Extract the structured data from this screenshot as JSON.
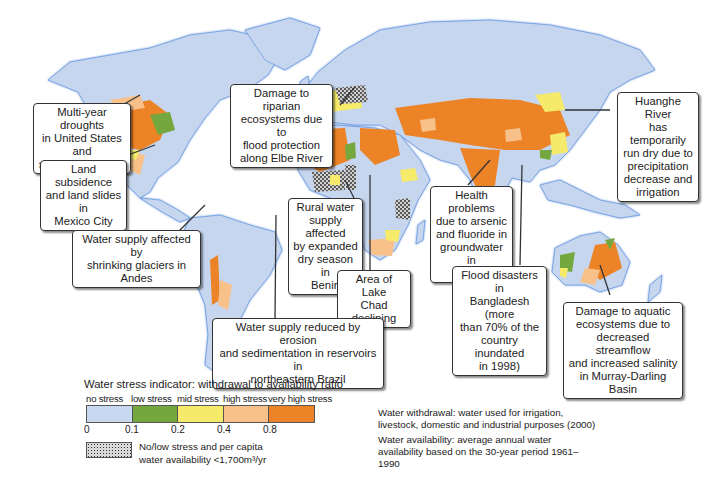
{
  "map": {
    "title": "Water stress and water-related impacts worldwide",
    "colors": {
      "ocean": "#ffffff",
      "land_no_stress": "#c6d6ef",
      "coast": "#6d9be0",
      "border": "#333333"
    }
  },
  "callouts": [
    {
      "id": "us-droughts",
      "text": "Multi-year droughts\nin United States and\nsouthern Canada"
    },
    {
      "id": "mexico-city",
      "text": "Land subsidence\nand land slides in\nMexico City"
    },
    {
      "id": "andes",
      "text": "Water supply affected by\nshrinking glaciers in Andes"
    },
    {
      "id": "elbe",
      "text": "Damage to riparian\necosystems due to\nflood protection\nalong Elbe River"
    },
    {
      "id": "benin",
      "text": "Rural water\nsupply affected\nby expanded\ndry season in\nBenin"
    },
    {
      "id": "lake-chad",
      "text": "Area of Lake\nChad declining"
    },
    {
      "id": "brazil",
      "text": "Water supply reduced by erosion\nand sedimentation in reservoirs in\nnortheastern Brazil"
    },
    {
      "id": "india",
      "text": "Health problems\ndue to arsenic\nand fluoride in\ngroundwater in\nIndia"
    },
    {
      "id": "bangladesh",
      "text": "Flood disasters in\nBangladesh (more\nthan 70% of the\ncountry inundated\nin 1998)"
    },
    {
      "id": "huanghe",
      "text": "Huanghe River\nhas temporarily\nrun dry due to\nprecipitation\ndecrease and\nirrigation"
    },
    {
      "id": "murray-darling",
      "text": "Damage to aquatic\necosystems due to\ndecreased streamflow\nand increased salinity\nin Murray-Darling Basin"
    }
  ],
  "legend": {
    "title": "Water stress indicator: withdrawal to availability ratio",
    "categories": [
      {
        "label": "no stress",
        "color": "#c8d8f0"
      },
      {
        "label": "low stress",
        "color": "#74a83e"
      },
      {
        "label": "mid stress",
        "color": "#f5ea6a"
      },
      {
        "label": "high stress",
        "color": "#f8c18a"
      },
      {
        "label": "very high stress",
        "color": "#ec8326"
      }
    ],
    "ticks": [
      "0",
      "0.1",
      "0.2",
      "0.4",
      "0.8"
    ],
    "hatch_label": "No/low stress and per capita water availability <1,700m³/yr"
  },
  "notes": {
    "withdrawal": "Water withdrawal: water used for irrigation, livestock, domestic and industrial purposes (2000)",
    "availability": "Water availability: average annual water availability based on the 30-year period 1961–1990"
  }
}
